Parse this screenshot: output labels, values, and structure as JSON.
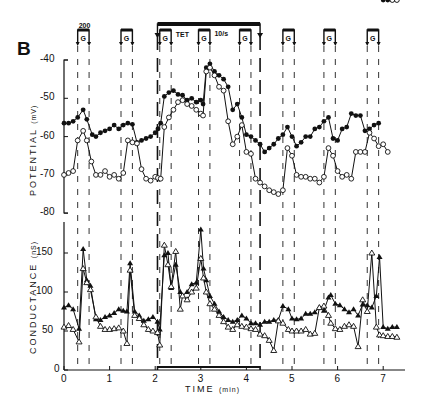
{
  "panel_label": "B",
  "annotations": {
    "pulse_label": "200",
    "tet_label": "TET",
    "rate_label": "10/s",
    "g_label": "G"
  },
  "axes": {
    "potential_label": "POTENTIAL",
    "potential_unit": "(mV)",
    "conductance_label": "CONDUCTANCE",
    "conductance_unit": "(nS)",
    "x_label": "TIME",
    "x_unit": "(min)",
    "potential_ticks": [
      "-40",
      "-50",
      "-60",
      "-70",
      "-80"
    ],
    "conductance_ticks": [
      "150",
      "100",
      "50",
      "0"
    ],
    "x_ticks": [
      "0",
      "1",
      "2",
      "3",
      "4",
      "5",
      "6",
      "7"
    ]
  },
  "chart_data": [
    {
      "type": "line",
      "title": "Membrane potential",
      "xlabel": "TIME (min)",
      "ylabel": "POTENTIAL (mV)",
      "ylim": [
        -80,
        -40
      ],
      "xlim": [
        0,
        7.5
      ],
      "grid": false,
      "series": [
        {
          "name": "filled circles",
          "marker": "filled-circle",
          "x": [
            0.0,
            0.1,
            0.2,
            0.3,
            0.42,
            0.5,
            0.62,
            0.7,
            0.8,
            0.9,
            1.0,
            1.1,
            1.2,
            1.3,
            1.4,
            1.5,
            1.6,
            1.7,
            1.8,
            1.9,
            2.0,
            2.06,
            2.12,
            2.2,
            2.3,
            2.4,
            2.5,
            2.6,
            2.7,
            2.8,
            2.9,
            3.0,
            3.05,
            3.12,
            3.2,
            3.3,
            3.4,
            3.5,
            3.6,
            3.7,
            3.8,
            3.9,
            4.0,
            4.1,
            4.2,
            4.3,
            4.4,
            4.5,
            4.6,
            4.7,
            4.8,
            4.9,
            5.0,
            5.1,
            5.2,
            5.3,
            5.4,
            5.5,
            5.6,
            5.7,
            5.8,
            5.9,
            6.0,
            6.1,
            6.2,
            6.3,
            6.4,
            6.5,
            6.6,
            6.7,
            6.8,
            6.9,
            7.0,
            7.1,
            7.2,
            7.3
          ],
          "values": [
            -56.5,
            -56.5,
            -56,
            -55,
            -53,
            -55.5,
            -59.5,
            -60,
            -59,
            -58.5,
            -58,
            -57,
            -58,
            -57,
            -56.5,
            -56.8,
            -61.5,
            -61,
            -60.5,
            -60,
            -59,
            -58,
            -56.5,
            -49.5,
            -48.5,
            -48,
            -49,
            -49.2,
            -50.5,
            -50,
            -51,
            -50.5,
            -51.5,
            -42,
            -41,
            -43,
            -44,
            -45,
            -47,
            -53,
            -51.5,
            -55,
            -59.5,
            -60,
            -61,
            -62,
            -64,
            -63,
            -62,
            -60.5,
            -59.5,
            -57.5,
            -60,
            -62.5,
            -61.5,
            -60,
            -60,
            -58,
            -57.5,
            -56,
            -55,
            -60.5,
            -61,
            -58,
            -57.5,
            -54,
            -54.5,
            -54.5,
            -58.5,
            -58,
            -57,
            -56.5
          ]
        },
        {
          "name": "open circles",
          "marker": "open-circle",
          "x": [
            0.0,
            0.1,
            0.2,
            0.3,
            0.42,
            0.5,
            0.6,
            0.7,
            0.8,
            0.9,
            1.0,
            1.1,
            1.2,
            1.3,
            1.4,
            1.5,
            1.6,
            1.7,
            1.8,
            1.9,
            2.0,
            2.06,
            2.12,
            2.2,
            2.3,
            2.4,
            2.5,
            2.6,
            2.7,
            2.8,
            2.9,
            3.0,
            3.05,
            3.12,
            3.2,
            3.3,
            3.4,
            3.5,
            3.6,
            3.7,
            3.8,
            3.9,
            4.0,
            4.1,
            4.2,
            4.3,
            4.4,
            4.5,
            4.6,
            4.7,
            4.8,
            4.9,
            5.0,
            5.1,
            5.2,
            5.3,
            5.4,
            5.5,
            5.6,
            5.7,
            5.8,
            5.9,
            6.0,
            6.1,
            6.2,
            6.3,
            6.4,
            6.5,
            6.6,
            6.7,
            6.8,
            6.9,
            7.0,
            7.1,
            7.2,
            7.3
          ],
          "values": [
            -70,
            -69.5,
            -69,
            -61,
            -58.5,
            -61,
            -66.5,
            -70,
            -70,
            -69,
            -70.5,
            -70,
            -71,
            -69.5,
            -61,
            -61.5,
            -61.8,
            -68.5,
            -71,
            -71.5,
            -70.5,
            -70.8,
            -71,
            -57.5,
            -55,
            -53,
            -51,
            -50.5,
            -51.5,
            -52,
            -53,
            -54,
            -54.5,
            -43,
            -42,
            -44,
            -47,
            -48,
            -56,
            -62,
            -60,
            -57,
            -64,
            -64.5,
            -71,
            -72,
            -73,
            -74,
            -74.5,
            -75,
            -74,
            -63,
            -65,
            -70,
            -70.5,
            -70.5,
            -71,
            -71,
            -72,
            -70.5,
            -63,
            -65,
            -69,
            -70.5,
            -70,
            -71,
            -64,
            -64,
            -64,
            -59,
            -60.5,
            -62.5,
            -62,
            -64
          ]
        }
      ]
    },
    {
      "type": "line",
      "title": "Membrane conductance",
      "xlabel": "TIME (min)",
      "ylabel": "CONDUCTANCE (nS)",
      "ylim": [
        0,
        180
      ],
      "xlim": [
        0,
        7.5
      ],
      "grid": false,
      "series": [
        {
          "name": "filled triangles",
          "marker": "filled-triangle",
          "x": [
            0.0,
            0.1,
            0.2,
            0.33,
            0.42,
            0.5,
            0.58,
            0.7,
            0.8,
            0.9,
            1.0,
            1.1,
            1.2,
            1.3,
            1.38,
            1.45,
            1.55,
            1.65,
            1.75,
            1.85,
            1.95,
            2.05,
            2.1,
            2.2,
            2.28,
            2.35,
            2.45,
            2.55,
            2.6,
            2.7,
            2.8,
            2.9,
            3.0,
            3.06,
            3.12,
            3.2,
            3.3,
            3.4,
            3.5,
            3.6,
            3.7,
            3.8,
            3.9,
            4.0,
            4.1,
            4.2,
            4.3,
            4.4,
            4.5,
            4.6,
            4.7,
            4.8,
            4.92,
            5.0,
            5.1,
            5.2,
            5.3,
            5.4,
            5.5,
            5.6,
            5.7,
            5.8,
            5.85,
            5.95,
            6.05,
            6.15,
            6.25,
            6.35,
            6.45,
            6.55,
            6.65,
            6.75,
            6.85,
            6.92,
            7.0,
            7.1,
            7.2,
            7.3
          ],
          "values": [
            80,
            83,
            78,
            53,
            155,
            115,
            108,
            65,
            64,
            68,
            70,
            73,
            78,
            76,
            75,
            137,
            75,
            70,
            63,
            65,
            68,
            62,
            52,
            147,
            150,
            105,
            135,
            100,
            95,
            100,
            110,
            112,
            180,
            130,
            115,
            95,
            85,
            75,
            68,
            64,
            62,
            64,
            70,
            66,
            60,
            60,
            58,
            62,
            62,
            64,
            64,
            82,
            78,
            66,
            65,
            66,
            72,
            72,
            74,
            80,
            76,
            93,
            96,
            85,
            83,
            78,
            74,
            78,
            70,
            84,
            83,
            80,
            95,
            145,
            55,
            53,
            55,
            55
          ]
        },
        {
          "name": "open triangles",
          "marker": "open-triangle",
          "x": [
            0.0,
            0.1,
            0.2,
            0.33,
            0.42,
            0.5,
            0.58,
            0.7,
            0.8,
            0.9,
            1.0,
            1.1,
            1.2,
            1.3,
            1.38,
            1.45,
            1.55,
            1.65,
            1.75,
            1.85,
            1.95,
            2.05,
            2.1,
            2.2,
            2.28,
            2.35,
            2.45,
            2.55,
            2.6,
            2.7,
            2.8,
            2.9,
            3.0,
            3.06,
            3.12,
            3.2,
            3.3,
            3.4,
            3.5,
            3.6,
            3.7,
            3.8,
            3.9,
            4.0,
            4.1,
            4.2,
            4.3,
            4.4,
            4.5,
            4.6,
            4.7,
            4.8,
            4.92,
            5.0,
            5.1,
            5.2,
            5.3,
            5.4,
            5.5,
            5.6,
            5.7,
            5.8,
            5.85,
            5.95,
            6.05,
            6.15,
            6.25,
            6.35,
            6.45,
            6.55,
            6.65,
            6.75,
            6.85,
            6.92,
            7.0,
            7.1,
            7.2,
            7.3
          ],
          "values": [
            55,
            57,
            52,
            36,
            130,
            112,
            103,
            68,
            56,
            52,
            52,
            53,
            54,
            50,
            34,
            128,
            70,
            66,
            58,
            52,
            50,
            48,
            32,
            160,
            135,
            107,
            152,
            78,
            95,
            90,
            100,
            105,
            143,
            118,
            100,
            85,
            78,
            70,
            62,
            55,
            52,
            58,
            56,
            55,
            53,
            52,
            46,
            44,
            38,
            25,
            63,
            60,
            52,
            50,
            50,
            50,
            52,
            46,
            47,
            80,
            82,
            70,
            60,
            53,
            52,
            56,
            58,
            56,
            30,
            90,
            75,
            150,
            55,
            45,
            44,
            43,
            43,
            42
          ]
        }
      ]
    }
  ],
  "stimulus_markers": {
    "g_pulses_min": [
      [
        0.3,
        0.55
      ],
      [
        1.25,
        1.5
      ],
      [
        2.1,
        2.35
      ],
      [
        2.95,
        3.2
      ],
      [
        3.85,
        4.1
      ],
      [
        4.8,
        5.05
      ],
      [
        5.7,
        5.95
      ],
      [
        6.65,
        6.9
      ]
    ],
    "tet_period_min": [
      2.05,
      4.3
    ]
  }
}
